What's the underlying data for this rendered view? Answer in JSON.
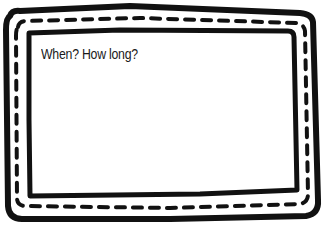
{
  "card": {
    "prompt": "When? How long?"
  },
  "colors": {
    "ink": "#111111",
    "background": "#ffffff"
  }
}
